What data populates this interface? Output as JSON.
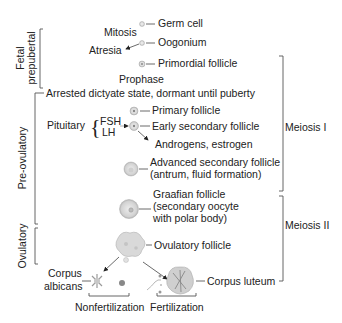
{
  "phases": {
    "fetal_prepubertal": [
      "Fetal",
      "prepubertal"
    ],
    "pre_ovulatory": "Pre-ovulatory",
    "ovulatory": "Ovulatory"
  },
  "meiosis": {
    "meiosis_1": "Meiosis I",
    "meiosis_2": "Meiosis II"
  },
  "processes": {
    "mitosis": "Mitosis",
    "atresia": "Atresia",
    "prophase": "Prophase",
    "arrested": "Arrested dictyate state, dormant until puberty",
    "pituitary": "Pituitary",
    "fsh": "FSH",
    "lh": "LH",
    "androgens": "Androgens, estrogen"
  },
  "stages": {
    "germ_cell": "Germ cell",
    "oogonium": "Oogonium",
    "primordial": "Primordial follicle",
    "primary": "Primary follicle",
    "early_secondary": "Early secondary follicle",
    "advanced_secondary": [
      "Advanced secondary follicle",
      "(antrum, fluid formation)"
    ],
    "graafian": [
      "Graafian follicle",
      "(secondary oocyte",
      "with polar body)"
    ],
    "ovulatory_follicle": "Ovulatory follicle",
    "corpus_albicans": [
      "Corpus",
      "albicans"
    ],
    "corpus_luteum": "Corpus luteum"
  },
  "outcomes": {
    "nonfertilization": "Nonfertilization",
    "fertilization": "Fertilization"
  }
}
